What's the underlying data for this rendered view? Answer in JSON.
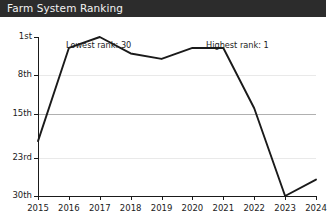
{
  "window": {
    "title": "Farm System Ranking",
    "titlebar_bg": "#2c2c2c",
    "title_color": "#f2f2f2"
  },
  "annotations": {
    "lowest": "Lowest rank: 30",
    "highest": "Highest rank: 1"
  },
  "axis": {
    "y_ticks": [
      "1st",
      "8th",
      "15th",
      "23rd",
      "30th"
    ],
    "x_ticks": [
      "2015",
      "2016",
      "2017",
      "2018",
      "2019",
      "2020",
      "2021",
      "2022",
      "2023",
      "2024"
    ]
  },
  "colors": {
    "line": "#1a1a1a",
    "grid": "#e9e9e9",
    "grid_major": "#b0b0b0",
    "axis": "#1a1a1a",
    "plot_bg": "#ffffff"
  },
  "chart_data": {
    "type": "line",
    "title": "Farm System Ranking",
    "xlabel": "",
    "ylabel": "",
    "x": [
      2015,
      2016,
      2017,
      2018,
      2019,
      2020,
      2021,
      2022,
      2023,
      2024
    ],
    "categories": [
      "2015",
      "2016",
      "2017",
      "2018",
      "2019",
      "2020",
      "2021",
      "2022",
      "2023",
      "2024"
    ],
    "series": [
      {
        "name": "Farm System Ranking",
        "values": [
          20,
          3,
          1,
          4,
          5,
          3,
          3,
          14,
          30,
          27
        ]
      }
    ],
    "ylim": [
      1,
      30
    ],
    "y_inverted": true,
    "y_tick_values": [
      1,
      8,
      15,
      23,
      30
    ],
    "y_tick_labels": [
      "1st",
      "8th",
      "15th",
      "23rd",
      "30th"
    ],
    "grid": true,
    "legend": "none",
    "annotations": [
      {
        "text": "Lowest rank: 30",
        "x": 2016,
        "position": "top-left"
      },
      {
        "text": "Highest rank: 1",
        "x": 2021,
        "position": "top-right"
      }
    ]
  }
}
